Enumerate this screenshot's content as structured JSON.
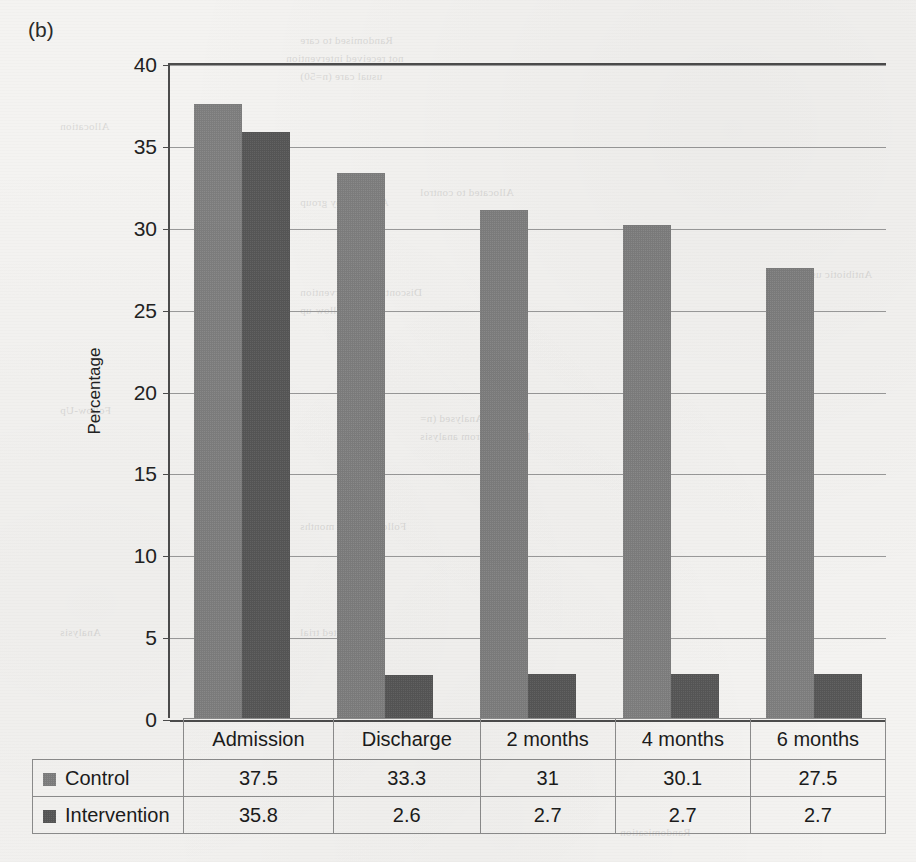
{
  "panel": {
    "label": "(b)"
  },
  "chart_data": {
    "type": "bar",
    "title": "",
    "xlabel": "",
    "ylabel": "Percentage",
    "ylim": [
      0,
      40
    ],
    "ytick_step": 5,
    "yticks": [
      40,
      35,
      30,
      25,
      20,
      15,
      10,
      5,
      0
    ],
    "ytick_labels": [
      "40",
      "35",
      "30",
      "25",
      "20",
      "15",
      "10",
      "5",
      "0"
    ],
    "grid": true,
    "legend_position": "table-below",
    "categories": [
      "Admission",
      "Discharge",
      "2 months",
      "4 months",
      "6 months"
    ],
    "series": [
      {
        "name": "Control",
        "color": "#7d7d7d",
        "values": [
          37.5,
          33.3,
          31,
          30.1,
          27.5
        ],
        "labels": [
          "37.5",
          "33.3",
          "31",
          "30.1",
          "27.5"
        ]
      },
      {
        "name": "Intervention",
        "color": "#565656",
        "values": [
          35.8,
          2.6,
          2.7,
          2.7,
          2.7
        ],
        "labels": [
          "35.8",
          "2.6",
          "2.7",
          "2.7",
          "2.7"
        ]
      }
    ]
  },
  "colors": {
    "control": "#7d7d7d",
    "intervention": "#565656",
    "axis": "#4c4c4c",
    "gridline": "#9a9a9a",
    "paper": "#f4f3f1"
  },
  "bleed_through": [
    {
      "text": "Randomised to care",
      "x": 300,
      "y": 34
    },
    {
      "text": "not received intervention",
      "x": 286,
      "y": 52
    },
    {
      "text": "usual care (n=50)",
      "x": 300,
      "y": 70
    },
    {
      "text": "Allocated to control",
      "x": 420,
      "y": 186
    },
    {
      "text": "Analysed by group",
      "x": 300,
      "y": 196
    },
    {
      "text": "Discontinued intervention",
      "x": 300,
      "y": 286
    },
    {
      "text": "lost to follow-up",
      "x": 300,
      "y": 304
    },
    {
      "text": "Analysed (n=",
      "x": 420,
      "y": 412
    },
    {
      "text": "Excluded from analysis",
      "x": 420,
      "y": 430
    },
    {
      "text": "Follow-up at 6 months",
      "x": 300,
      "y": 520
    },
    {
      "text": "Completed trial",
      "x": 300,
      "y": 626
    },
    {
      "text": "Allocation",
      "x": 60,
      "y": 120
    },
    {
      "text": "Follow-Up",
      "x": 60,
      "y": 404
    },
    {
      "text": "Analysis",
      "x": 60,
      "y": 626
    },
    {
      "text": "Antibiotic use",
      "x": 806,
      "y": 268
    },
    {
      "text": "Randomisation",
      "x": 620,
      "y": 826
    }
  ]
}
